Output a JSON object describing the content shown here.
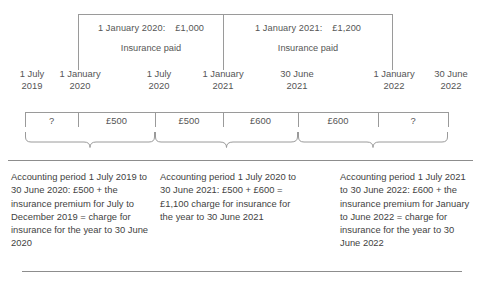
{
  "diagram": {
    "line_color": "#9a9a9a",
    "text_color": "#4a4a4a"
  },
  "payments": [
    {
      "id": "payment-2020",
      "date": "1 January 2020:",
      "amount": "£1,000",
      "caption": "Insurance paid"
    },
    {
      "id": "payment-2021",
      "date": "1 January 2021:",
      "amount": "£1,200",
      "caption": "Insurance paid"
    }
  ],
  "timeline_dates": [
    {
      "day": "1 July",
      "year": "2019"
    },
    {
      "day": "1 January",
      "year": "2020"
    },
    {
      "day": "1 July",
      "year": "2020"
    },
    {
      "day": "1 January",
      "year": "2021"
    },
    {
      "day": "30 June",
      "year": "2021"
    },
    {
      "day": "1 January",
      "year": "2022"
    },
    {
      "day": "30 June",
      "year": "2022"
    }
  ],
  "segments": [
    {
      "label": "?"
    },
    {
      "label": "£500"
    },
    {
      "label": "£500"
    },
    {
      "label": "£600"
    },
    {
      "label": "£600"
    },
    {
      "label": "?"
    }
  ],
  "periods": [
    {
      "text": "Accounting period 1 July 2019 to 30 June 2020: £500 + the insurance premium for July to December 2019 = charge for insurance for the year to 30 June 2020"
    },
    {
      "text": "Accounting period 1 July 2020 to 30 June 2021: £500 + £600 = £1,100 charge for insurance for the year to 30 June 2021"
    },
    {
      "text": "Accounting period 1 July 2021 to 30 June 2022: £600 + the insurance premium for January to June 2022 = charge for insurance for the year to 30 June 2022"
    }
  ]
}
